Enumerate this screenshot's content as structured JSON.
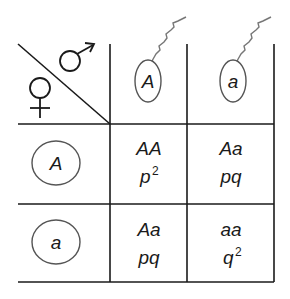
{
  "diagram": {
    "type": "punnett-square",
    "header": {
      "male_symbol": "male-symbol",
      "female_symbol": "female-symbol",
      "male_gametes": [
        {
          "allele": "A",
          "kind": "sperm"
        },
        {
          "allele": "a",
          "kind": "sperm"
        }
      ],
      "female_gametes": [
        {
          "allele": "A",
          "kind": "egg"
        },
        {
          "allele": "a",
          "kind": "egg"
        }
      ]
    },
    "cells": [
      [
        {
          "genotype": "AA",
          "freq_base": "p",
          "freq_exp": "2"
        },
        {
          "genotype": "Aa",
          "freq_base": "pq",
          "freq_exp": ""
        }
      ],
      [
        {
          "genotype": "Aa",
          "freq_base": "pq",
          "freq_exp": ""
        },
        {
          "genotype": "aa",
          "freq_base": "q",
          "freq_exp": "2"
        }
      ]
    ],
    "colors": {
      "line": "#1a1a1a",
      "gamete_outline": "#555555",
      "sperm_tail": "#777777",
      "background": "#ffffff"
    }
  }
}
